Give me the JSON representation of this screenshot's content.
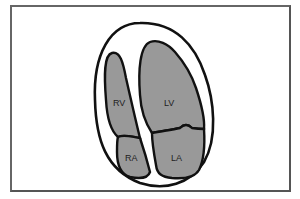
{
  "diagram": {
    "type": "apical four-chamber heart view",
    "chambers": [
      {
        "id": "rv",
        "label": "RV"
      },
      {
        "id": "lv",
        "label": "LV"
      },
      {
        "id": "ra",
        "label": "RA"
      },
      {
        "id": "la",
        "label": "LA"
      }
    ],
    "colors": {
      "chamber_fill": "#999999",
      "outline": "#111111",
      "frame": "#555555",
      "background": "#ffffff"
    }
  }
}
